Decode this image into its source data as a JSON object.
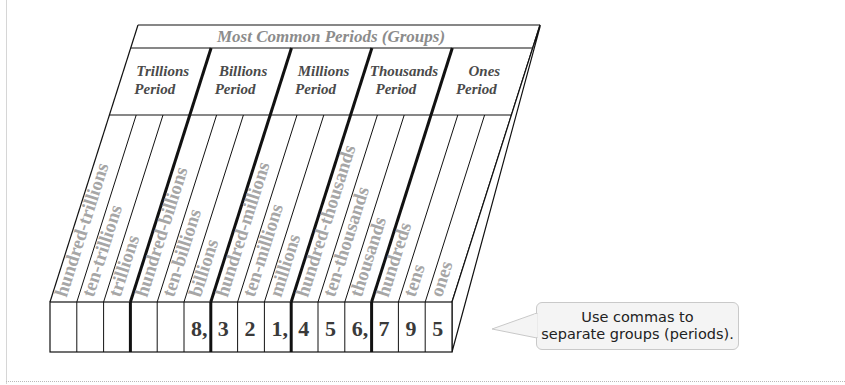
{
  "title_clipped": "ing Up",
  "diagram": {
    "header_title": "Most Common Periods (Groups)",
    "periods": [
      {
        "line1": "Trillions",
        "line2": "Period"
      },
      {
        "line1": "Billions",
        "line2": "Period"
      },
      {
        "line1": "Millions",
        "line2": "Period"
      },
      {
        "line1": "Thousands",
        "line2": "Period"
      },
      {
        "line1": "Ones",
        "line2": "Period"
      }
    ],
    "place_values": [
      "hundred-trillions",
      "ten-trillions",
      "trillions",
      "hundred-billions",
      "ten-billions",
      "billions",
      "hundred-millions",
      "ten-millions",
      "millions",
      "hundred-thousands",
      "ten-thousands",
      "thousands",
      "hundreds",
      "tens",
      "ones"
    ],
    "digits": [
      "",
      "",
      "",
      "",
      "",
      "8,",
      "3",
      "2",
      "1,",
      "4",
      "5",
      "6,",
      "7",
      "9",
      "5"
    ],
    "number": "8,321,456,795",
    "colors": {
      "header_text": "#8c8c8c",
      "period_text": "#4a4a4a",
      "place_text": "#a6a6a6",
      "digit_text": "#3a3a3a",
      "line": "#111111"
    }
  },
  "callout": {
    "text": "Use commas to\nseparate groups (periods)."
  }
}
